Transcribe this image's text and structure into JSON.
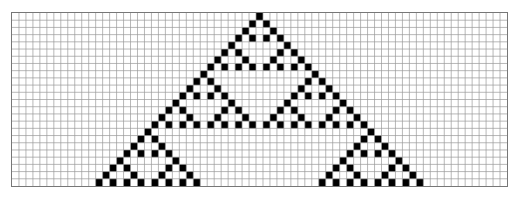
{
  "diagram": {
    "type": "cellular-automaton",
    "rule": 90,
    "columns": 71,
    "rows": 24,
    "seed_column": 35,
    "colors": {
      "alive": "#000000",
      "dead": "#ffffff",
      "gridline": "#9a9a9a",
      "border": "#777777"
    }
  }
}
